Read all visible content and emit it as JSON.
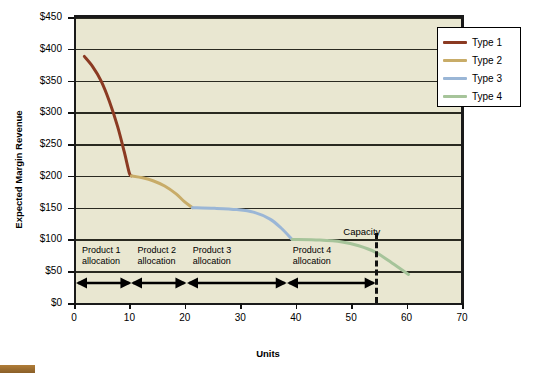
{
  "chart_data": {
    "type": "line",
    "title": "",
    "xlabel": "Units",
    "ylabel": "Expected Margin Revenue",
    "xlim": [
      0,
      70
    ],
    "ylim": [
      0,
      450
    ],
    "xticks": [
      0,
      10,
      20,
      30,
      40,
      50,
      60,
      70
    ],
    "yticks": [
      0,
      50,
      100,
      150,
      200,
      250,
      300,
      350,
      400,
      450
    ],
    "ytick_labels": [
      "$0",
      "$50",
      "$100",
      "$150",
      "$200",
      "$250",
      "$300",
      "$350",
      "$400",
      "$450"
    ],
    "xtick_labels": [
      "0",
      "10",
      "20",
      "30",
      "40",
      "50",
      "60",
      "70"
    ],
    "grid": true,
    "grid_axis": "y",
    "legend_position": "top-right",
    "plot_background": "#e9e7d1",
    "series": [
      {
        "name": "Type 1",
        "color": "#8b3a22",
        "points": [
          [
            1.5,
            388
          ],
          [
            3,
            372
          ],
          [
            4.5,
            350
          ],
          [
            6,
            318
          ],
          [
            7.5,
            278
          ],
          [
            8.7,
            238
          ],
          [
            9.6,
            205
          ],
          [
            10,
            200
          ]
        ]
      },
      {
        "name": "Type 2",
        "color": "#c8ac68",
        "points": [
          [
            10,
            200
          ],
          [
            12,
            197
          ],
          [
            14,
            192
          ],
          [
            16,
            184
          ],
          [
            18,
            172
          ],
          [
            19.5,
            160
          ],
          [
            21,
            150
          ]
        ]
      },
      {
        "name": "Type 3",
        "color": "#9ab6d6",
        "points": [
          [
            21,
            150
          ],
          [
            25,
            149
          ],
          [
            29,
            147
          ],
          [
            32,
            143
          ],
          [
            35,
            132
          ],
          [
            37,
            118
          ],
          [
            39,
            100
          ]
        ]
      },
      {
        "name": "Type 4",
        "color": "#a6c49a",
        "points": [
          [
            39,
            100
          ],
          [
            44,
            99
          ],
          [
            48,
            96
          ],
          [
            51,
            90
          ],
          [
            54,
            80
          ],
          [
            57,
            63
          ],
          [
            60,
            45
          ]
        ]
      }
    ],
    "annotations": {
      "capacity": {
        "label": "Capacity",
        "x": 54,
        "line_style": "dashed",
        "color": "#111111"
      },
      "allocations": [
        {
          "label_line1": "Product 1",
          "label_line2": "allocation",
          "x_start": 0,
          "x_end": 10
        },
        {
          "label_line1": "Product 2",
          "label_line2": "allocation",
          "x_start": 10,
          "x_end": 20
        },
        {
          "label_line1": "Product 3",
          "label_line2": "allocation",
          "x_start": 20,
          "x_end": 38
        },
        {
          "label_line1": "Product 4",
          "label_line2": "allocation",
          "x_start": 38,
          "x_end": 54
        }
      ]
    }
  },
  "legend": {
    "entries": [
      {
        "label": "Type 1",
        "color": "#8b3a22"
      },
      {
        "label": "Type 2",
        "color": "#c8ac68"
      },
      {
        "label": "Type 3",
        "color": "#9ab6d6"
      },
      {
        "label": "Type 4",
        "color": "#a6c49a"
      }
    ]
  }
}
